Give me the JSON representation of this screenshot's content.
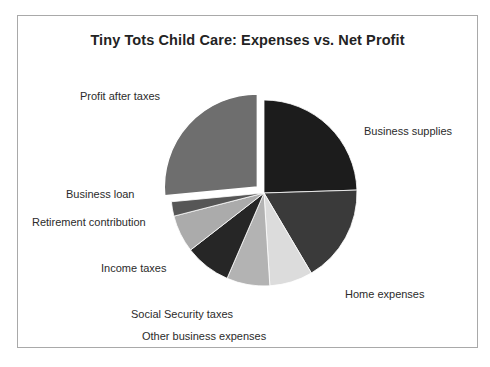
{
  "chart_data": {
    "type": "pie",
    "title": "Tiny Tots Child Care: Expenses vs. Net Profit",
    "xlabel": "",
    "ylabel": "",
    "legend": "none (direct slice labels)",
    "grid": false,
    "exploded_slice": "Profit after taxes",
    "start_angle_deg": 0,
    "direction": "clockwise",
    "categories": [
      "Business supplies",
      "Home expenses",
      "Other business expenses",
      "Social Security taxes",
      "Income taxes",
      "Retirement contribution",
      "Business loan",
      "Profit after taxes"
    ],
    "values": [
      24.5,
      17.0,
      7.5,
      7.5,
      8.0,
      6.5,
      2.5,
      26.5
    ],
    "colors": [
      "#1c1c1c",
      "#3a3a3a",
      "#dcdcdc",
      "#b3b3b3",
      "#262626",
      "#ababab",
      "#565656",
      "#6e6e6e"
    ],
    "slices": [
      {
        "label": "Business supplies",
        "value": 24.5,
        "color": "#1c1c1c",
        "exploded": false
      },
      {
        "label": "Home expenses",
        "value": 17.0,
        "color": "#3a3a3a",
        "exploded": false
      },
      {
        "label": "Other business expenses",
        "value": 7.5,
        "color": "#dcdcdc",
        "exploded": false
      },
      {
        "label": "Social Security taxes",
        "value": 7.5,
        "color": "#b3b3b3",
        "exploded": false
      },
      {
        "label": "Income taxes",
        "value": 8.0,
        "color": "#262626",
        "exploded": false
      },
      {
        "label": "Retirement contribution",
        "value": 6.5,
        "color": "#ababab",
        "exploded": false
      },
      {
        "label": "Business loan",
        "value": 2.5,
        "color": "#565656",
        "exploded": false
      },
      {
        "label": "Profit after taxes",
        "value": 26.5,
        "color": "#6e6e6e",
        "exploded": true
      }
    ]
  },
  "chart": {
    "title": "Tiny Tots Child Care: Expenses vs. Net Profit",
    "labels": {
      "profit_after_taxes": "Profit after taxes",
      "business_supplies": "Business supplies",
      "home_expenses": "Home expenses",
      "other_business_expenses": "Other business expenses",
      "social_security_taxes": "Social Security taxes",
      "income_taxes": "Income taxes",
      "retirement_contribution": "Retirement contribution",
      "business_loan": "Business loan"
    }
  },
  "style": {
    "frame_border_color": "#a9a9a9",
    "background": "#ffffff",
    "title_color": "#232323",
    "label_color": "#2b2b2b"
  }
}
